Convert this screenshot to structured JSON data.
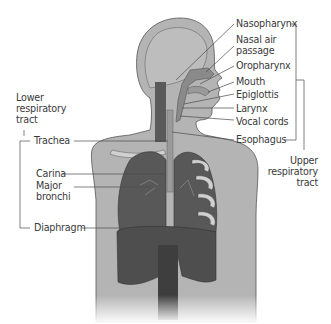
{
  "diagram": {
    "colors": {
      "background": "#ffffff",
      "body": "#b4b4b4",
      "outline": "#555555",
      "lungs": "#585858",
      "airway": "#8a8a8a",
      "ribs": "#d0d0d0",
      "label_text": "#3a3a3a",
      "leader_line": "#4a4a4a"
    },
    "groups": {
      "upper": {
        "label_line1": "Upper",
        "label_line2": "respiratory",
        "label_line3": "tract"
      },
      "lower": {
        "label_line1": "Lower",
        "label_line2": "respiratory",
        "label_line3": "tract"
      }
    },
    "labels_right": [
      {
        "text": "Nasopharynx"
      },
      {
        "text": "Nasal air"
      },
      {
        "text": "passage"
      },
      {
        "text": "Oropharynx"
      },
      {
        "text": "Mouth"
      },
      {
        "text": "Epiglottis"
      },
      {
        "text": "Larynx"
      },
      {
        "text": "Vocal cords"
      },
      {
        "text": "Esophagus"
      }
    ],
    "labels_left": [
      {
        "text": "Trachea"
      },
      {
        "text": "Carina"
      },
      {
        "text": "Major"
      },
      {
        "text": "bronchi"
      },
      {
        "text": "Diaphragm"
      }
    ]
  }
}
